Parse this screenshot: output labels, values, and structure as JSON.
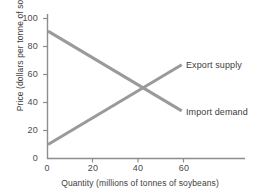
{
  "chart_data": {
    "type": "line",
    "title": "",
    "subtitle": "",
    "xlabel": "Quantity (millions of tonnes of soybeans)",
    "ylabel": "Price (dollars per tonne of soybeans)",
    "xlim": [
      0,
      70
    ],
    "ylim": [
      0,
      105
    ],
    "xticks": [
      0,
      20,
      40,
      60
    ],
    "yticks": [
      0,
      20,
      40,
      60,
      80,
      100
    ],
    "xtick_labels": [
      "0",
      "20",
      "40",
      "60"
    ],
    "ytick_labels": [
      "0",
      "20",
      "40",
      "60",
      "80",
      "100"
    ],
    "grid": false,
    "legend_position": "inline-right-of-line-ends",
    "line_color": "#9a9a9a",
    "axis_color": "#8d8d8d",
    "text_color": "#3d3d3d",
    "background": "#ffffff",
    "equilibrium": {
      "quantity": 40,
      "price": 50
    },
    "series": [
      {
        "name": "Export supply",
        "label": "Export supply",
        "color": "#9a9a9a",
        "x": [
          0,
          59
        ],
        "values": [
          10,
          67
        ]
      },
      {
        "name": "Import demand",
        "label": "Import demand",
        "color": "#9a9a9a",
        "x": [
          0,
          59
        ],
        "values": [
          91,
          34
        ]
      }
    ]
  },
  "axis": {
    "y_title": "Price (dollars per tonne of soybeans)",
    "x_title": "Quantity (millions of tonnes of soybeans)",
    "y_ticks": [
      "100",
      "80",
      "60",
      "40",
      "20",
      "0"
    ],
    "x_ticks": [
      "0",
      "20",
      "40",
      "60"
    ]
  },
  "labels": {
    "export_supply": "Export supply",
    "import_demand": "Import demand"
  }
}
